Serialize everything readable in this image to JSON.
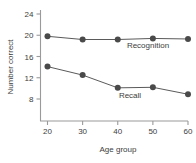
{
  "chart_data": {
    "type": "line",
    "title": "",
    "xlabel": "Age group",
    "ylabel": "Number correct",
    "x": [
      20,
      30,
      40,
      50,
      60
    ],
    "xticks": [
      "20",
      "30",
      "40",
      "50",
      "60"
    ],
    "yticks": [
      "8",
      "12",
      "16",
      "20",
      "24"
    ],
    "ylim": [
      6,
      24
    ],
    "xlim": [
      15,
      63
    ],
    "grid": false,
    "legend_position": "inline-annotation",
    "series": [
      {
        "name": "Recognition",
        "values": [
          19.8,
          19.2,
          19.2,
          19.4,
          19.3
        ],
        "color": "#4a4a4a",
        "annotation": "Recognition"
      },
      {
        "name": "Recall",
        "values": [
          14.1,
          12.5,
          10.1,
          10.2,
          8.9
        ],
        "color": "#4a4a4a",
        "annotation": "Recall"
      }
    ]
  }
}
